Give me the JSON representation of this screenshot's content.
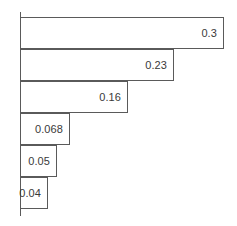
{
  "chart_data": {
    "type": "bar",
    "orientation": "horizontal",
    "title": "",
    "subtitle": "",
    "xlabel": "",
    "ylabel": "",
    "grid": false,
    "legend": null,
    "legend_position": "none",
    "axis": {
      "value_axis": "x",
      "category_axis": "y",
      "xlim": [
        0,
        0.3
      ],
      "x_ticks": [],
      "y_ticks": [],
      "tick_labels_visible": false,
      "axis_line_visible": true,
      "axis_line_color": "#5a5a5a"
    },
    "categories": [
      "",
      "",
      "",
      "",
      "",
      ""
    ],
    "values": [
      0.3,
      0.23,
      0.16,
      0.068,
      0.05,
      0.04
    ],
    "data_labels": [
      "0.3",
      "0.23",
      "0.16",
      "0.068",
      "0.05",
      "0.04"
    ],
    "data_label_position": "inside-end",
    "bars": [
      {
        "index": 0,
        "value": 0.3,
        "label": "0.3",
        "bar_width_px": 204
      },
      {
        "index": 1,
        "value": 0.23,
        "label": "0.23",
        "bar_width_px": 154
      },
      {
        "index": 2,
        "value": 0.16,
        "label": "0.16",
        "bar_width_px": 108
      },
      {
        "index": 3,
        "value": 0.068,
        "label": "0.068",
        "bar_width_px": 50
      },
      {
        "index": 4,
        "value": 0.05,
        "label": "0.05",
        "bar_width_px": 37
      },
      {
        "index": 5,
        "value": 0.04,
        "label": "0.04",
        "bar_width_px": 28
      }
    ],
    "style": {
      "bar_fill": "#ffffff",
      "bar_border": "#5a5a5a",
      "label_color": "#3a3a3a",
      "background": "#ffffff",
      "bar_height_px": 32
    }
  }
}
